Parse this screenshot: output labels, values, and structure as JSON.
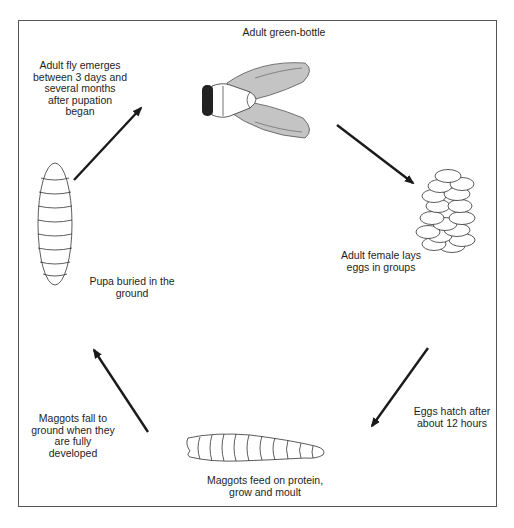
{
  "diagram": {
    "type": "life-cycle",
    "stages": [
      {
        "id": "adult",
        "label": "Adult green-bottle",
        "icon": "fly-icon"
      },
      {
        "id": "eggs",
        "label_lines": [
          "Adult female lays",
          "eggs in groups"
        ],
        "icon": "eggs-icon"
      },
      {
        "id": "maggot",
        "label_lines": [
          "Maggots feed on protein,",
          "grow and moult"
        ],
        "icon": "maggot-icon"
      },
      {
        "id": "pupa",
        "label_lines": [
          "Pupa buried in the",
          "ground"
        ],
        "icon": "pupa-icon"
      }
    ],
    "transitions": [
      {
        "from": "adult",
        "to": "eggs",
        "label_lines": []
      },
      {
        "from": "eggs",
        "to": "maggot",
        "label_lines": [
          "Eggs hatch after",
          "about 12 hours"
        ]
      },
      {
        "from": "maggot",
        "to": "pupa",
        "label_lines": [
          "Maggots fall to",
          "ground when they",
          "are fully",
          "developed"
        ]
      },
      {
        "from": "pupa",
        "to": "adult",
        "label_lines": [
          "Adult fly emerges",
          "between 3 days and",
          "several months",
          "after pupation",
          "began"
        ]
      }
    ],
    "colors": {
      "wing": "#c4c4c4",
      "head": "#222222",
      "line": "#1a1a1a"
    }
  }
}
